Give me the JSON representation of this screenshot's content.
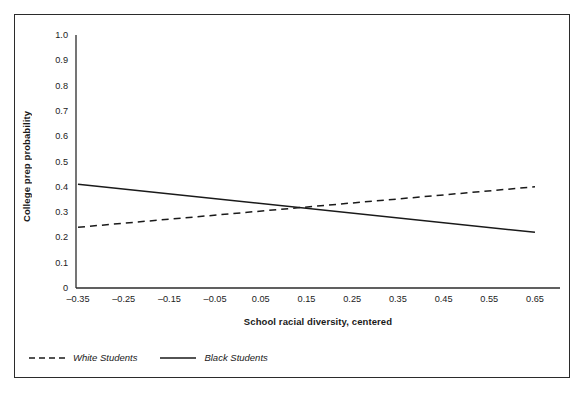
{
  "chart_data": {
    "type": "line",
    "title": "",
    "xlabel": "School racial diversity, centered",
    "ylabel": "College prep probability",
    "xlim": [
      -0.4,
      0.7
    ],
    "ylim": [
      0,
      1.0
    ],
    "grid": false,
    "legend_position": "below-plot-left",
    "xticks": [
      "–0.35",
      "–0.25",
      "–0.15",
      "–0.05",
      "0.05",
      "0.15",
      "0.25",
      "0.35",
      "0.45",
      "0.55",
      "0.65"
    ],
    "xtick_values": [
      -0.35,
      -0.25,
      -0.15,
      -0.05,
      0.05,
      0.15,
      0.25,
      0.35,
      0.45,
      0.55,
      0.65
    ],
    "yticks": [
      "0",
      "0.1",
      "0.2",
      "0.3",
      "0.4",
      "0.5",
      "0.6",
      "0.7",
      "0.8",
      "0.9",
      "1.0"
    ],
    "ytick_values": [
      0,
      0.1,
      0.2,
      0.3,
      0.4,
      0.5,
      0.6,
      0.7,
      0.8,
      0.9,
      1.0
    ],
    "x": [
      -0.35,
      0.65
    ],
    "series": [
      {
        "name": "White Students",
        "style": "dashed",
        "color": "#1a1a1a",
        "values": [
          0.24,
          0.4
        ]
      },
      {
        "name": "Black Students",
        "style": "solid",
        "color": "#1a1a1a",
        "values": [
          0.41,
          0.22
        ]
      }
    ],
    "legend": [
      "White Students",
      "Black Students"
    ]
  }
}
